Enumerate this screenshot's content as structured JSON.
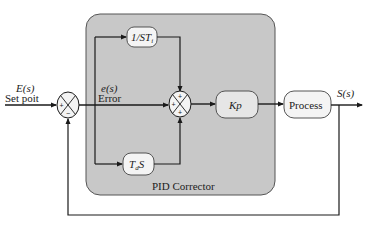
{
  "diagram": {
    "type": "pid-control-block-diagram",
    "corrector_label": "PID Corrector",
    "input": {
      "signal": "E(s)",
      "label": "Set poit"
    },
    "error": {
      "signal": "e(s)",
      "label": "Error"
    },
    "output": {
      "signal": "S(s)"
    },
    "blocks": {
      "integral": {
        "main": "1/ST",
        "sub": "i"
      },
      "derivative": {
        "main": "T",
        "sub": "d",
        "tail": "S"
      },
      "gain": "Kp",
      "process": "Process"
    },
    "junction1": {
      "signs": [
        "+",
        "−"
      ]
    },
    "junction2": {
      "signs": [
        "+",
        "+",
        "+"
      ]
    },
    "colors": {
      "corrector_fill": "#c8c8c8",
      "corrector_stroke": "#555555",
      "block_fill": "#f4f4f4",
      "line": "#1a1a1a"
    }
  }
}
